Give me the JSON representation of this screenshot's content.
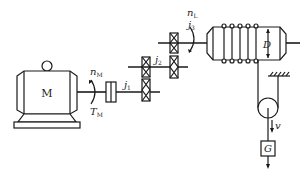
{
  "diagram": {
    "motor": {
      "label": "M"
    },
    "motor_speed": {
      "symbol": "n",
      "sub": "M"
    },
    "motor_torque": {
      "symbol": "T",
      "sub": "M"
    },
    "gear_stage_1": {
      "symbol": "j",
      "sub": "1"
    },
    "gear_stage_2": {
      "symbol": "j",
      "sub": "2"
    },
    "gear_stage_3": {
      "symbol": "j",
      "sub": "3"
    },
    "drum_speed": {
      "symbol": "n",
      "sub": "L"
    },
    "drum_diameter": {
      "label": "D"
    },
    "velocity": {
      "label": "v"
    },
    "load": {
      "label": "G"
    }
  }
}
